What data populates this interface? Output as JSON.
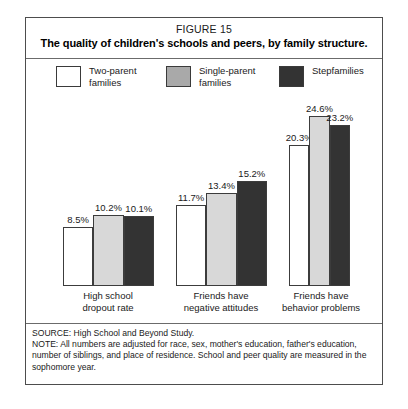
{
  "figure": {
    "number": "FIGURE 15",
    "title": "The quality of children's schools and peers, by family structure."
  },
  "legend": {
    "items": [
      {
        "label": "Two-parent\nfamilies",
        "color": "#ffffff"
      },
      {
        "label": "Single-parent\nfamilies",
        "color": "#a9a9a9"
      },
      {
        "label": "Stepfamilies",
        "color": "#333333"
      }
    ]
  },
  "footnote": {
    "source": "SOURCE: High School and Beyond Study.",
    "note": "NOTE: All numbers are adjusted for race, sex, mother's education, father's education, number of siblings, and place of residence. School and peer quality are measured in the sophomore year."
  },
  "chart_data": {
    "type": "bar",
    "title": "The quality of children's schools and peers, by family structure.",
    "subtitle": "FIGURE 15",
    "xlabel": "",
    "ylabel": "",
    "ylim": [
      0,
      26
    ],
    "grid": false,
    "legend_position": "top",
    "value_suffix": "%",
    "categories": [
      "High school\ndropout rate",
      "Friends have\nnegative attitudes",
      "Friends have\nbehavior problems"
    ],
    "series": [
      {
        "name": "Two-parent families",
        "color": "#ffffff",
        "values": [
          8.5,
          11.7,
          20.3
        ],
        "labels": [
          "8.5%",
          "11.7%",
          "20.3%"
        ]
      },
      {
        "name": "Single-parent families",
        "color": "#d8d8d8",
        "values": [
          10.2,
          13.4,
          24.6
        ],
        "labels": [
          "10.2%",
          "13.4%",
          "24.6%"
        ]
      },
      {
        "name": "Stepfamilies",
        "color": "#333333",
        "values": [
          10.1,
          15.2,
          23.2
        ],
        "labels": [
          "10.1%",
          "15.2%",
          "23.2%"
        ]
      }
    ]
  }
}
